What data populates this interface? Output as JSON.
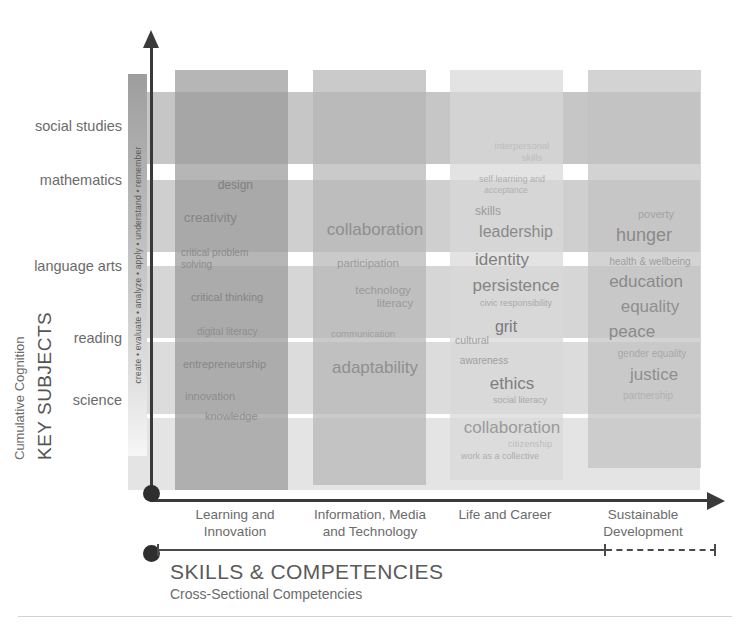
{
  "chart_data": {
    "type": "heatmap",
    "title": "",
    "xlabel": "SKILLS & COMPETENCIES",
    "xlabel_sub": "Cross-Sectional Competencies",
    "ylabel": "KEY SUBJECTS",
    "ylabel_sub": "Cumulative Cognition",
    "grid": false,
    "legend_position": "none",
    "categories": [
      "Learning and Innovation",
      "Information, Media and Technology",
      "Life and Career",
      "Sustainable Development"
    ],
    "rows": [
      "social studies",
      "mathematics",
      "language arts",
      "reading",
      "science"
    ],
    "cognition_scale": "create • evaluate • analyze • apply • understand • remember",
    "series": [
      {
        "name": "Learning and Innovation",
        "items": [
          "design",
          "creativity",
          "critical problem solving",
          "critical thinking",
          "digital literacy",
          "entrepreneurship",
          "innovation",
          "knowledge"
        ]
      },
      {
        "name": "Information, Media and Technology",
        "items": [
          "collaboration",
          "participation",
          "technology literacy",
          "communication",
          "adaptability"
        ]
      },
      {
        "name": "Life and Career",
        "items": [
          "interpersonal skills",
          "self learning and acceptance",
          "skills",
          "leadership",
          "identity",
          "persistence",
          "civic responsibility",
          "grit",
          "cultural",
          "awareness",
          "ethics",
          "social literacy",
          "collaboration",
          "citizenship",
          "work as a collective"
        ]
      },
      {
        "name": "Sustainable Development",
        "items": [
          "poverty",
          "hunger",
          "health & wellbeing",
          "education",
          "equality",
          "peace",
          "gender equality",
          "justice",
          "partnership"
        ]
      }
    ]
  },
  "axes": {
    "y_title": "KEY SUBJECTS",
    "y_subtitle": "Cumulative Cognition",
    "y_ticks": [
      "social studies",
      "mathematics",
      "language arts",
      "reading",
      "science"
    ],
    "bloom_strip": "create • evaluate • analyze • apply • understand • remember",
    "x_title": "SKILLS & COMPETENCIES",
    "x_subtitle": "Cross-Sectional Competencies",
    "x_ticks": [
      {
        "line1": "Learning and",
        "line2": "Innovation"
      },
      {
        "line1": "Information, Media",
        "line2": "and Technology"
      },
      {
        "line1": "Life and Career",
        "line2": ""
      },
      {
        "line1": "Sustainable",
        "line2": "Development"
      }
    ]
  },
  "words": {
    "c1": [
      {
        "t": "design",
        "x": 78,
        "y": 108,
        "s": 12,
        "c": "#7f7f7f",
        "a": "right"
      },
      {
        "t": "creativity",
        "x": 62,
        "y": 140,
        "s": 13.5,
        "c": "#858585",
        "a": "right"
      },
      {
        "t": "critical problem",
        "x": 6,
        "y": 177,
        "s": 10,
        "c": "#8b8b8b",
        "a": "left"
      },
      {
        "t": "solving",
        "x": 6,
        "y": 189,
        "s": 10,
        "c": "#8b8b8b",
        "a": "left"
      },
      {
        "t": "critical thinking",
        "x": 16,
        "y": 221,
        "s": 11,
        "c": "#858585",
        "a": "left"
      },
      {
        "t": "digital  literacy",
        "x": 22,
        "y": 256,
        "s": 10,
        "c": "#8d8d8d",
        "a": "left"
      },
      {
        "t": "entrepreneurship",
        "x": 8,
        "y": 288,
        "s": 11,
        "c": "#878787",
        "a": "left"
      },
      {
        "t": "innovation",
        "x": 10,
        "y": 320,
        "s": 11,
        "c": "#8d8d8d",
        "a": "left"
      },
      {
        "t": "knowledge",
        "x": 30,
        "y": 340,
        "s": 11,
        "c": "#8f8f8f",
        "a": "left"
      }
    ],
    "c2": [
      {
        "t": "collaboration",
        "x": 62,
        "y": 150,
        "s": 17,
        "c": "#8f8f8f",
        "a": "center"
      },
      {
        "t": "participation",
        "x": 55,
        "y": 187,
        "s": 11.5,
        "c": "#9a9a9a",
        "a": "center"
      },
      {
        "t": "technology",
        "x": 70,
        "y": 214,
        "s": 11.5,
        "c": "#9a9a9a",
        "a": "center"
      },
      {
        "t": "literacy",
        "x": 82,
        "y": 227,
        "s": 11.5,
        "c": "#9a9a9a",
        "a": "center"
      },
      {
        "t": "communication",
        "x": 50,
        "y": 258,
        "s": 9.5,
        "c": "#9e9e9e",
        "a": "center"
      },
      {
        "t": "adaptability",
        "x": 62,
        "y": 288,
        "s": 17,
        "c": "#8f8f8f",
        "a": "center"
      }
    ],
    "c3": [
      {
        "t": "interpersonal",
        "x": 72,
        "y": 70,
        "s": 9.5,
        "c": "#bdbdbd",
        "a": "center"
      },
      {
        "t": "skills",
        "x": 82,
        "y": 82,
        "s": 9.5,
        "c": "#bdbdbd",
        "a": "center"
      },
      {
        "t": "self learning and",
        "x": 62,
        "y": 104,
        "s": 9,
        "c": "#b0b0b0",
        "a": "center"
      },
      {
        "t": "acceptance",
        "x": 56,
        "y": 115,
        "s": 8.5,
        "c": "#b0b0b0",
        "a": "center"
      },
      {
        "t": "skills",
        "x": 38,
        "y": 134,
        "s": 12,
        "c": "#9a9a9a",
        "a": "center"
      },
      {
        "t": "leadership",
        "x": 66,
        "y": 153,
        "s": 16,
        "c": "#8a8a8a",
        "a": "center"
      },
      {
        "t": "identity",
        "x": 52,
        "y": 180,
        "s": 17,
        "c": "#7f7f7f",
        "a": "center"
      },
      {
        "t": "persistence",
        "x": 66,
        "y": 206,
        "s": 17,
        "c": "#858585",
        "a": "center"
      },
      {
        "t": "civic responsibility",
        "x": 66,
        "y": 228,
        "s": 9,
        "c": "#a8a8a8",
        "a": "center"
      },
      {
        "t": "grit",
        "x": 56,
        "y": 248,
        "s": 16,
        "c": "#7a7a7a",
        "a": "center"
      },
      {
        "t": "cultural",
        "x": 22,
        "y": 264,
        "s": 10.5,
        "c": "#a0a0a0",
        "a": "center"
      },
      {
        "t": "awareness",
        "x": 34,
        "y": 285,
        "s": 10,
        "c": "#a0a0a0",
        "a": "center"
      },
      {
        "t": "ethics",
        "x": 62,
        "y": 304,
        "s": 17,
        "c": "#7f7f7f",
        "a": "center"
      },
      {
        "t": "social literacy",
        "x": 70,
        "y": 325,
        "s": 9,
        "c": "#a8a8a8",
        "a": "center"
      },
      {
        "t": "collaboration",
        "x": 62,
        "y": 348,
        "s": 17,
        "c": "#9a9a9a",
        "a": "center"
      },
      {
        "t": "citizenship",
        "x": 80,
        "y": 368,
        "s": 9.5,
        "c": "#bcbcbc",
        "a": "center"
      },
      {
        "t": "work as a collective",
        "x": 50,
        "y": 381,
        "s": 9,
        "c": "#aeaeae",
        "a": "center"
      }
    ],
    "c4": [
      {
        "t": "poverty",
        "x": 68,
        "y": 138,
        "s": 11,
        "c": "#a2a2a2",
        "a": "center"
      },
      {
        "t": "hunger",
        "x": 56,
        "y": 155,
        "s": 18,
        "c": "#8a8a8a",
        "a": "center"
      },
      {
        "t": "health & wellbeing",
        "x": 62,
        "y": 186,
        "s": 10,
        "c": "#9e9e9e",
        "a": "center"
      },
      {
        "t": "education",
        "x": 58,
        "y": 202,
        "s": 17,
        "c": "#8a8a8a",
        "a": "center"
      },
      {
        "t": "equality",
        "x": 62,
        "y": 227,
        "s": 17,
        "c": "#8f8f8f",
        "a": "center"
      },
      {
        "t": "peace",
        "x": 44,
        "y": 252,
        "s": 17,
        "c": "#8a8a8a",
        "a": "center"
      },
      {
        "t": "gender equality",
        "x": 64,
        "y": 278,
        "s": 10,
        "c": "#a8a8a8",
        "a": "center"
      },
      {
        "t": "justice",
        "x": 66,
        "y": 295,
        "s": 17,
        "c": "#8f8f8f",
        "a": "center"
      },
      {
        "t": "partnership",
        "x": 60,
        "y": 320,
        "s": 10,
        "c": "#b0b0b0",
        "a": "center"
      }
    ]
  },
  "bands": {
    "rows": [
      {
        "y": 22,
        "h": 72,
        "bg": "#c6c6c6"
      },
      {
        "y": 110,
        "h": 72,
        "bg": "#cfcfcf"
      },
      {
        "y": 196,
        "h": 72,
        "bg": "#d6d6d6"
      },
      {
        "y": 272,
        "h": 72,
        "bg": "#dcdcdc"
      },
      {
        "y": 348,
        "h": 72,
        "bg": "#e4e4e4"
      }
    ],
    "cols": [
      {
        "x": 25,
        "w": 113,
        "h": 420,
        "bg": "#9a9a9a"
      },
      {
        "x": 163,
        "w": 113,
        "h": 415,
        "bg": "#b5b5b5"
      },
      {
        "x": 300,
        "w": 113,
        "h": 410,
        "bg": "#d8d8d8"
      },
      {
        "x": 438,
        "w": 113,
        "h": 398,
        "bg": "#c2c2c2"
      }
    ]
  },
  "colors": {
    "axis": "#3a3a3a",
    "text": "#6b6b6b",
    "band_dark": "#9a9a9a",
    "band_light": "#e4e4e4"
  }
}
